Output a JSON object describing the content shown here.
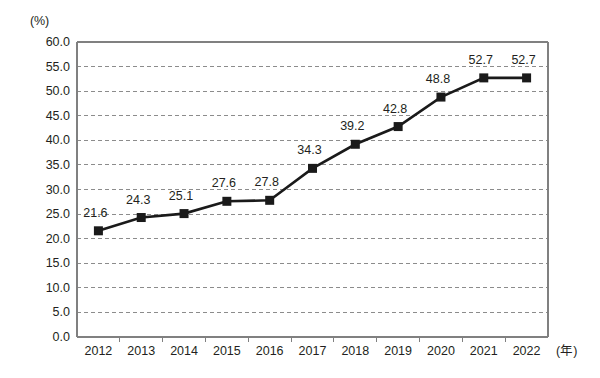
{
  "chart_data": {
    "type": "line",
    "title": "",
    "xlabel": "(年)",
    "ylabel": "(%)",
    "categories": [
      "2012",
      "2013",
      "2014",
      "2015",
      "2016",
      "2017",
      "2018",
      "2019",
      "2020",
      "2021",
      "2022"
    ],
    "values": [
      21.6,
      24.3,
      25.1,
      27.6,
      27.8,
      34.3,
      39.2,
      42.8,
      48.8,
      52.7,
      52.7
    ],
    "data_labels": [
      "21.6",
      "24.3",
      "25.1",
      "27.6",
      "27.8",
      "34.3",
      "39.2",
      "42.8",
      "48.8",
      "52.7",
      "52.7"
    ],
    "ylim": [
      0,
      60
    ],
    "ytick_step": 5,
    "ytick_labels": [
      "60.0",
      "55.0",
      "50.0",
      "45.0",
      "40.0",
      "35.0",
      "30.0",
      "25.0",
      "20.0",
      "15.0",
      "10.0",
      "5.0",
      "0.0"
    ],
    "ytick_values": [
      60,
      55,
      50,
      45,
      40,
      35,
      30,
      25,
      20,
      15,
      10,
      5,
      0
    ],
    "grid": true,
    "grid_axis": "y",
    "legend": "none",
    "series_color": "#1a1a1a",
    "grid_color": "#8c8c8c",
    "axis_color": "#808080",
    "marker": "square",
    "background": "#ffffff"
  }
}
